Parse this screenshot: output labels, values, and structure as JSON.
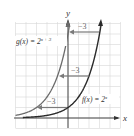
{
  "chart_data": {
    "type": "line",
    "title": "",
    "xlabel": "x",
    "ylabel": "y",
    "xlim": [
      -5,
      5
    ],
    "ylim": [
      -1,
      9
    ],
    "grid": true,
    "series": [
      {
        "name": "f(x) = 2^x",
        "label_main": "f(x) = 2",
        "label_exp": "x",
        "color": "#2a2a2a",
        "points": [
          [
            -5,
            0.03125
          ],
          [
            -4,
            0.0625
          ],
          [
            -3,
            0.125
          ],
          [
            -2,
            0.25
          ],
          [
            -1,
            0.5
          ],
          [
            0,
            1
          ],
          [
            1,
            2
          ],
          [
            2,
            4
          ],
          [
            3,
            8
          ]
        ]
      },
      {
        "name": "g(x) = 2^(x+3)",
        "label_main": "g(x) = 2",
        "label_exp": "x + 3",
        "color": "#6b6b6b",
        "points": [
          [
            -5,
            0.25
          ],
          [
            -4,
            0.5
          ],
          [
            -3,
            1
          ],
          [
            -2,
            2
          ],
          [
            -1,
            4
          ],
          [
            0,
            8
          ]
        ]
      }
    ],
    "annotations": [
      {
        "text": "−3",
        "type": "arrow",
        "from": [
          3,
          8
        ],
        "to": [
          0,
          8
        ]
      },
      {
        "text": "−3",
        "type": "arrow",
        "from": [
          2,
          4
        ],
        "to": [
          -1,
          4
        ]
      },
      {
        "text": "−3",
        "type": "arrow",
        "from": [
          0,
          1
        ],
        "to": [
          -3,
          1
        ]
      }
    ]
  },
  "labels": {
    "x_axis": "x",
    "y_axis": "y",
    "f_main": "f(x) = 2",
    "f_exp": "x",
    "g_main": "g(x) = 2",
    "g_exp": "x + 3",
    "shift_top": "−3",
    "shift_mid": "−3",
    "shift_bot": "−3"
  },
  "colors": {
    "grid": "#d6d6d6",
    "axis": "#333333",
    "f_curve": "#2a2a2a",
    "g_curve": "#6b6b6b",
    "arrow": "#7a7a7a"
  }
}
